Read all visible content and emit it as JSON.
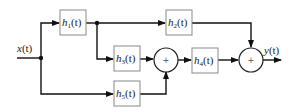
{
  "diagram": {
    "type": "signal-flow block diagram",
    "input": {
      "label": "x",
      "arg": "(t)"
    },
    "output": {
      "label": "y",
      "arg": "(t)"
    },
    "blocks": [
      {
        "id": "h1",
        "name": "h",
        "sub": "1",
        "arg": "(t)"
      },
      {
        "id": "h2",
        "name": "h",
        "sub": "2",
        "arg": "(t)"
      },
      {
        "id": "h3",
        "name": "h",
        "sub": "3",
        "arg": "(t)"
      },
      {
        "id": "h4",
        "name": "h",
        "sub": "4",
        "arg": "(t)"
      },
      {
        "id": "h5",
        "name": "h",
        "sub": "5",
        "arg": "(t)"
      }
    ],
    "summers": [
      {
        "id": "sum1",
        "symbol": "+"
      },
      {
        "id": "sum2",
        "symbol": "+"
      }
    ],
    "connections": [
      "x(t) -> h1",
      "x(t) -> h5",
      "h1 -> h2",
      "h1 -> h3",
      "h3 -> sum1",
      "h5 -> sum1",
      "sum1 -> h4",
      "h4 -> sum2",
      "h2 -> sum2",
      "sum2 -> y(t)"
    ]
  }
}
